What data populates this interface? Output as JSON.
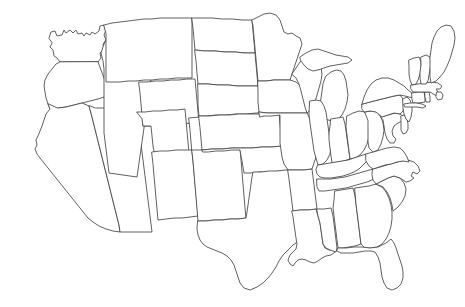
{
  "document": {
    "type": "map",
    "title": "Blank outline map of the contiguous United States",
    "subject": "United States state boundaries",
    "projection_look": "conic",
    "labels_present": false,
    "legend_present": false,
    "scale_bar_present": false,
    "compass_present": false
  },
  "canvas": {
    "width": 465,
    "height": 307,
    "background_color": "#ffffff"
  },
  "style": {
    "fill_color": "#ffffff",
    "stroke_color": "#444444",
    "stroke_width": 0.85
  },
  "regions": [
    {
      "name": "washington",
      "label": "Washington",
      "d": "M49,38 L51,32 L55,31 L57,36 L62,35 L64,30 L66,33 L70,30 L73,33 L76,30 L78,34 L82,33 L84,36 L86,33 L90,35 L92,32 L95,34 L99,31 L100,26 L104,25 L106,30 L104,35 L106,40 L103,44 L104,49 L100,53 L101,58 L98,62 L60,62 L57,58 L54,56 L53,50 L50,47 L52,43 Z"
    },
    {
      "name": "oregon",
      "label": "Oregon",
      "d": "M98,62 L101,70 L104,78 L106,86 L108,94 L104,97 L98,99 L90,101 L82,103 L74,105 L66,107 L58,108 L50,109 L48,104 L46,98 L45,92 L44,86 L45,80 L48,74 L52,69 L56,64 L60,62 Z"
    },
    {
      "name": "california",
      "label": "California",
      "d": "M48,104 L50,109 L46,114 L44,120 L42,126 L40,131 L38,136 L36,140 L37,145 L35,149 L37,154 L40,158 L44,163 L48,168 L52,173 L56,178 L60,183 L64,188 L68,193 L72,198 L76,203 L80,208 L84,213 L88,218 L93,222 L99,226 L106,229 L113,231 L120,232 L119,225 L117,217 L115,209 L113,201 L111,193 L109,185 L107,177 L105,169 L103,161 L101,153 L99,145 L97,137 L95,129 L93,121 L91,113 L89,106 L82,103 L74,105 L66,107 L58,108 Z"
    },
    {
      "name": "nevada",
      "label": "Nevada",
      "d": "M89,106 L91,113 L93,121 L95,129 L97,137 L99,145 L101,153 L103,161 L105,169 L107,177 L109,185 L111,193 L113,201 L115,209 L117,217 L119,225 L120,232 L128,232 L136,232 L144,232 L152,232 L151,224 L150,216 L149,208 L148,200 L147,192 L146,184 L145,176 L144,168 L143,160 L142,152 L141,144 L140,136 L139,128 L138,120 L137,112 L136,104 L128,105 L120,106 L112,107 L104,108 L96,108 Z"
    },
    {
      "name": "idaho",
      "label": "Idaho",
      "d": "M106,40 L110,38 L114,41 L118,39 L122,43 L126,40 L130,44 L134,41 L138,45 L142,42 L146,46 L150,43 L154,47 L158,44 L160,48 L158,54 L156,60 L154,66 L152,72 L151,79 L150,86 L149,93 L148,100 L147,107 L146,114 L145,121 L144,128 L143,135 L142,142 L141,149 L140,156 L139,163 L138,170 L137,177 L130,176 L123,175 L116,174 L109,173 L108,165 L107,157 L106,149 L105,141 L104,133 L104,125 L104,117 L104,109 L104,101 L104,93 L104,85 L104,77 L104,69 L103,61 L101,53 L103,47 Z"
    },
    {
      "name": "montana",
      "label": "Montana",
      "d": "M104,25 L112,23 L120,22 L128,21 L136,20 L144,19 L152,19 L160,18 L168,18 L176,18 L184,18 L192,18 L192,30 L192,42 L192,54 L192,66 L192,78 L184,78 L176,78 L168,79 L160,79 L152,80 L144,80 L136,81 L128,81 L120,82 L112,82 L106,82 L106,70 L106,58 L106,46 L106,34 Z"
    },
    {
      "name": "wyoming",
      "label": "Wyoming",
      "d": "M139,82 L147,82 L155,81 L163,81 L171,80 L179,80 L187,79 L195,79 L196,90 L197,101 L198,112 L199,123 L191,123 L183,124 L175,124 L167,125 L159,125 L151,126 L143,126 L142,115 L141,104 L140,93 Z"
    },
    {
      "name": "utah",
      "label": "Utah",
      "d": "M137,112 L145,112 L153,111 L161,111 L169,110 L177,110 L185,109 L186,120 L187,131 L188,142 L189,153 L190,164 L182,165 L174,165 L166,166 L158,166 L155,156 L153,146 L152,136 L151,126 L143,126 L142,119 Z"
    },
    {
      "name": "colorado",
      "label": "Colorado",
      "d": "M189,118 L199,117 L209,117 L219,116 L229,116 L239,115 L249,115 L250,127 L251,139 L252,151 L253,163 L243,163 L233,164 L223,164 L213,165 L203,165 L193,166 L192,154 L191,142 L190,130 Z"
    },
    {
      "name": "arizona",
      "label": "Arizona",
      "d": "M152,152 L160,151 L168,151 L176,150 L184,150 L192,150 L193,161 L194,172 L195,183 L196,194 L197,205 L198,216 L190,217 L182,218 L174,218 L166,219 L158,220 L157,209 L156,198 L155,187 L154,176 L153,164 Z"
    },
    {
      "name": "new-mexico",
      "label": "New Mexico",
      "d": "M192,150 L200,150 L208,149 L216,149 L224,148 L232,148 L240,148 L241,160 L242,172 L243,184 L244,196 L245,208 L246,218 L238,219 L230,219 L222,220 L214,220 L206,221 L198,221 L197,209 L196,197 L195,185 L194,173 L193,161 Z"
    },
    {
      "name": "north-dakota",
      "label": "North Dakota",
      "d": "M192,18 L202,18 L212,18 L222,19 L232,19 L242,20 L252,20 L253,31 L254,42 L255,53 L245,53 L235,52 L225,52 L215,51 L205,51 L195,50 L194,39 L193,28 Z"
    },
    {
      "name": "south-dakota",
      "label": "South Dakota",
      "d": "M195,50 L205,51 L215,51 L225,52 L235,52 L245,53 L255,53 L256,64 L257,75 L258,86 L248,86 L238,86 L228,85 L218,85 L208,84 L198,84 L197,73 L196,61 Z"
    },
    {
      "name": "nebraska",
      "label": "Nebraska",
      "d": "M198,84 L208,84 L218,85 L228,85 L238,86 L248,86 L258,86 L268,87 L272,92 L274,98 L275,105 L276,112 L266,113 L256,113 L246,114 L236,114 L226,115 L216,115 L206,116 L199,116 L198,105 L198,94 Z"
    },
    {
      "name": "kansas",
      "label": "Kansas",
      "d": "M199,116 L209,116 L219,115 L229,115 L239,114 L249,114 L259,114 L269,113 L279,113 L280,124 L281,135 L282,146 L272,147 L262,147 L252,148 L242,148 L232,148 L222,149 L212,149 L202,150 L201,139 L200,128 Z"
    },
    {
      "name": "oklahoma",
      "label": "Oklahoma",
      "d": "M202,150 L212,149 L222,149 L232,148 L242,148 L252,148 L262,147 L272,147 L282,146 L284,152 L286,158 L288,164 L290,170 L280,171 L270,172 L260,172 L250,173 L244,173 L243,167 L242,161 L241,156 L240,150 L232,150 L224,151 L216,151 L208,152 L203,152 Z"
    },
    {
      "name": "texas",
      "label": "Texas",
      "d": "M198,221 L206,221 L214,220 L222,220 L230,219 L238,219 L246,218 L247,212 L248,205 L249,198 L250,191 L251,184 L252,177 L253,172 L261,172 L269,171 L277,171 L285,170 L290,170 L292,176 L293,183 L295,190 L298,196 L302,201 L306,206 L310,210 L313,215 L315,221 L314,228 L310,233 L305,237 L299,241 L293,245 L288,250 L283,255 L279,261 L276,267 L272,273 L268,278 L263,283 L257,287 L250,290 L244,288 L240,283 L238,277 L236,271 L234,265 L231,260 L227,256 L222,253 L217,251 L212,249 L207,247 L203,244 L200,240 L198,235 L197,229 Z"
    },
    {
      "name": "minnesota",
      "label": "Minnesota",
      "d": "M252,20 L258,17 L264,14 L270,13 L276,15 L280,20 L282,26 L284,32 L288,34 L292,33 L296,36 L300,38 L302,44 L300,50 L298,56 L296,62 L294,68 L292,74 L290,80 L282,80 L274,80 L266,81 L258,81 L257,70 L256,59 L255,48 L254,37 L253,26 Z"
    },
    {
      "name": "iowa",
      "label": "Iowa",
      "d": "M258,81 L266,81 L274,80 L282,80 L290,80 L296,82 L301,86 L305,90 L308,95 L310,101 L309,108 L307,113 L299,113 L291,113 L283,113 L275,113 L267,113 L259,112 L258,102 L258,92 Z"
    },
    {
      "name": "missouri",
      "label": "Missouri",
      "d": "M259,112 L267,113 L275,113 L283,113 L291,113 L299,113 L307,113 L310,119 L313,125 L316,131 L318,137 L319,144 L318,151 L316,157 L314,163 L312,169 L304,170 L296,170 L288,170 L284,164 L282,157 L281,150 L280,143 L280,136 L280,129 L280,122 L280,115 L272,116 L264,116 L260,117 Z"
    },
    {
      "name": "arkansas",
      "label": "Arkansas",
      "d": "M288,170 L296,170 L304,170 L312,169 L313,177 L314,185 L315,193 L316,201 L317,209 L309,210 L301,210 L293,211 L292,203 L291,195 L290,187 L289,179 Z"
    },
    {
      "name": "louisiana",
      "label": "Louisiana",
      "d": "M292,211 L300,210 L308,210 L316,209 L318,216 L320,223 L321,230 L322,237 L323,244 L325,248 L329,250 L333,249 L335,252 L331,255 L326,256 L322,258 L318,261 L314,263 L310,262 L306,260 L302,259 L298,260 L295,263 L293,266 L290,264 L288,260 L290,255 L293,252 L296,249 L297,244 L296,238 L295,231 L294,224 L293,217 Z"
    },
    {
      "name": "wisconsin",
      "label": "Wisconsin",
      "d": "M292,74 L296,68 L300,62 L304,58 L309,56 L314,58 L318,62 L321,67 L322,74 L321,81 L319,88 L317,95 L315,102 L313,108 L307,113 L305,107 L303,99 L301,91 L299,84 L296,78 Z"
    },
    {
      "name": "michigan-lower",
      "label": "Michigan (Lower Peninsula)",
      "d": "M326,76 L331,72 L336,70 L341,71 L344,75 L346,81 L347,88 L348,95 L347,102 L345,109 L342,115 L338,119 L333,121 L328,120 L324,117 L321,112 L320,105 L321,98 L322,91 L323,84 Z"
    },
    {
      "name": "michigan-upper",
      "label": "Michigan (Upper Peninsula)",
      "d": "M300,57 L306,53 L312,50 L318,49 L324,51 L330,53 L336,55 L342,56 L348,57 L352,60 L348,63 L342,64 L336,65 L330,66 L324,68 L318,70 L313,71 L308,69 L304,65 L301,61 Z"
    },
    {
      "name": "illinois",
      "label": "Illinois",
      "d": "M310,101 L316,100 L321,101 L324,106 L326,112 L327,119 L328,126 L329,133 L330,140 L331,147 L330,154 L327,160 L323,164 L318,165 L316,158 L314,151 L313,144 L312,137 L311,130 L310,123 L309,115 Z"
    },
    {
      "name": "indiana",
      "label": "Indiana",
      "d": "M331,119 L337,118 L343,117 L345,124 L346,131 L347,138 L348,145 L349,152 L350,159 L344,161 L338,162 L332,163 L331,156 L330,148 L329,140 L329,133 L330,126 Z"
    },
    {
      "name": "ohio",
      "label": "Ohio",
      "d": "M347,116 L353,113 L359,111 L365,112 L369,116 L370,123 L370,130 L369,137 L367,144 L364,150 L360,155 L355,158 L350,159 L349,151 L348,143 L347,135 L346,127 Z"
    },
    {
      "name": "kentucky",
      "label": "Kentucky",
      "d": "M318,165 L324,164 L330,163 L336,162 L342,161 L348,160 L354,158 L360,156 L366,154 L370,156 L367,161 L363,165 L359,169 L354,172 L349,174 L343,176 L337,177 L331,178 L325,178 L320,177 L317,174 L316,170 Z"
    },
    {
      "name": "tennessee",
      "label": "Tennessee",
      "d": "M317,179 L324,179 L331,179 L338,178 L345,177 L352,175 L359,173 L366,171 L373,169 L380,168 L384,172 L380,176 L374,179 L367,182 L360,184 L353,186 L346,188 L339,189 L332,190 L325,191 L319,191 L317,187 Z"
    },
    {
      "name": "mississippi",
      "label": "Mississippi",
      "d": "M317,209 L324,209 L331,208 L333,216 L334,224 L335,232 L336,240 L337,248 L336,252 L330,250 L326,248 L323,244 L322,237 L321,230 L320,223 L318,216 Z"
    },
    {
      "name": "alabama",
      "label": "Alabama",
      "d": "M335,191 L341,190 L347,189 L353,188 L355,196 L356,204 L357,212 L358,220 L359,228 L360,236 L361,244 L355,246 L349,247 L343,248 L338,248 L337,240 L336,232 L335,224 L334,216 L333,208 L334,200 Z"
    },
    {
      "name": "georgia",
      "label": "Georgia",
      "d": "M355,188 L362,187 L369,186 L376,184 L382,187 L386,192 L389,198 L391,205 L392,212 L392,219 L391,226 L389,233 L386,239 L382,244 L377,247 L371,248 L365,248 L361,244 L360,236 L359,228 L358,220 L357,212 L356,204 Z"
    },
    {
      "name": "florida",
      "label": "Florida",
      "d": "M338,248 L346,248 L354,247 L362,247 L370,248 L378,247 L386,243 L391,239 L394,243 L396,248 L398,254 L400,260 L402,266 L403,272 L403,278 L401,284 L397,288 L392,290 L387,288 L384,283 L382,277 L381,270 L380,263 L378,257 L375,252 L371,251 L365,251 L359,252 L353,253 L347,253 L341,253 L337,251 Z"
    },
    {
      "name": "south-carolina",
      "label": "South Carolina",
      "d": "M376,184 L382,181 L388,178 L394,176 L400,178 L404,183 L406,189 L405,196 L402,202 L398,207 L393,211 L392,205 L390,198 L387,192 L383,187 Z"
    },
    {
      "name": "north-carolina",
      "label": "North Carolina",
      "d": "M373,169 L380,167 L387,165 L394,163 L401,161 L408,160 L414,162 L418,166 L420,171 L417,174 L413,172 L411,176 L414,178 L410,181 L406,182 L400,178 L394,176 L388,178 L382,181 L376,184 L373,180 L372,175 Z"
    },
    {
      "name": "virginia",
      "label": "Virginia",
      "d": "M366,154 L373,152 L380,150 L387,148 L394,147 L400,148 L404,152 L407,157 L409,162 L403,161 L397,162 L391,164 L385,165 L379,167 L373,169 L369,166 L366,161 Z"
    },
    {
      "name": "west-virginia",
      "label": "West Virginia",
      "d": "M365,112 L371,111 L377,112 L381,117 L383,123 L384,130 L383,137 L381,144 L378,150 L373,152 L369,148 L368,142 L368,135 L368,128 L368,121 Z"
    },
    {
      "name": "maryland",
      "label": "Maryland",
      "d": "M381,117 L388,115 L395,113 L400,114 L404,117 L402,121 L398,123 L394,126 L392,131 L393,136 L396,139 L394,143 L390,143 L387,139 L385,133 L384,126 L383,120 Z"
    },
    {
      "name": "delaware",
      "label": "Delaware",
      "d": "M401,116 L404,115 L407,119 L408,124 L408,129 L406,133 L403,134 L401,130 L401,125 L401,120 Z"
    },
    {
      "name": "pennsylvania",
      "label": "Pennsylvania",
      "d": "M362,104 L370,102 L378,100 L386,98 L394,96 L400,95 L403,99 L404,105 L403,111 L400,114 L394,113 L388,115 L382,117 L376,112 L370,111 L364,112 L362,109 Z"
    },
    {
      "name": "new-jersey",
      "label": "New Jersey",
      "d": "M403,99 L407,97 L410,100 L412,105 L412,111 L411,117 L409,122 L406,119 L404,114 L403,108 Z"
    },
    {
      "name": "new-york",
      "label": "New York",
      "d": "M362,104 L364,97 L367,90 L371,84 L376,80 L382,78 L388,78 L394,80 L399,83 L404,86 L408,90 L412,93 L416,95 L413,98 L409,97 L405,96 L400,95 L394,96 L386,98 L378,100 L370,102 Z"
    },
    {
      "name": "connecticut",
      "label": "Connecticut",
      "d": "M412,93 L418,92 L424,92 L425,97 L425,102 L419,103 L413,103 L412,99 Z"
    },
    {
      "name": "rhode-island",
      "label": "Rhode Island",
      "d": "M425,92 L429,92 L430,97 L430,102 L426,102 L425,97 Z"
    },
    {
      "name": "massachusetts",
      "label": "Massachusetts",
      "d": "M411,85 L418,84 L425,83 L432,82 L438,83 L442,86 L440,89 L436,89 L438,92 L441,95 L437,96 L433,94 L430,92 L425,92 L419,92 L413,92 L411,89 Z"
    },
    {
      "name": "vermont",
      "label": "Vermont",
      "d": "M409,60 L414,58 L419,57 L421,62 L421,68 L420,74 L418,80 L416,84 L412,85 L410,80 L409,74 L409,67 Z"
    },
    {
      "name": "new-hampshire",
      "label": "New Hampshire",
      "d": "M421,57 L426,55 L430,57 L431,63 L430,69 L429,75 L428,81 L426,84 L421,84 L420,78 L420,72 L421,65 Z"
    },
    {
      "name": "maine",
      "label": "Maine",
      "d": "M430,57 L431,50 L432,43 L434,37 L437,31 L441,27 L446,25 L451,26 L454,31 L455,38 L454,45 L452,52 L450,59 L447,66 L444,72 L440,77 L436,81 L431,83 L430,77 L430,71 L430,64 Z"
    },
    {
      "name": "long-island",
      "label": "Long Island",
      "d": "M404,104 L410,103 L416,103 L422,104 L426,106 L423,108 L417,107 L411,107 L405,107 Z"
    },
    {
      "name": "cape-cod",
      "label": "Cape Cod",
      "d": "M437,92 L441,92 L443,95 L442,99 L438,100 L436,97 Z"
    }
  ]
}
